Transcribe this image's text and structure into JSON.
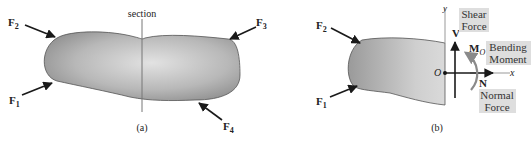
{
  "figure_a": {
    "caption": "(a)",
    "section_label": "section",
    "forces": [
      {
        "name": "F",
        "sub": "1"
      },
      {
        "name": "F",
        "sub": "2"
      },
      {
        "name": "F",
        "sub": "3"
      },
      {
        "name": "F",
        "sub": "4"
      }
    ]
  },
  "figure_b": {
    "caption": "(b)",
    "forces": [
      {
        "name": "F",
        "sub": "1"
      },
      {
        "name": "F",
        "sub": "2"
      }
    ],
    "origin": "O",
    "axis_x": "x",
    "axis_y": "y",
    "shear_symbol": "V",
    "normal_symbol": "N",
    "moment_symbol": "M",
    "moment_sub": "O",
    "shear_label_line1": "Shear",
    "shear_label_line2": "Force",
    "bending_label_line1": "Bending",
    "bending_label_line2": "Moment",
    "normal_label_line1": "Normal",
    "normal_label_line2": "Force"
  },
  "colors": {
    "body_dark": "#8e8e8e",
    "body_light": "#dcdcdc",
    "label_box": "#dedede",
    "arrow": "#1a1a1a",
    "moment_arrow": "#8a8a8a"
  }
}
